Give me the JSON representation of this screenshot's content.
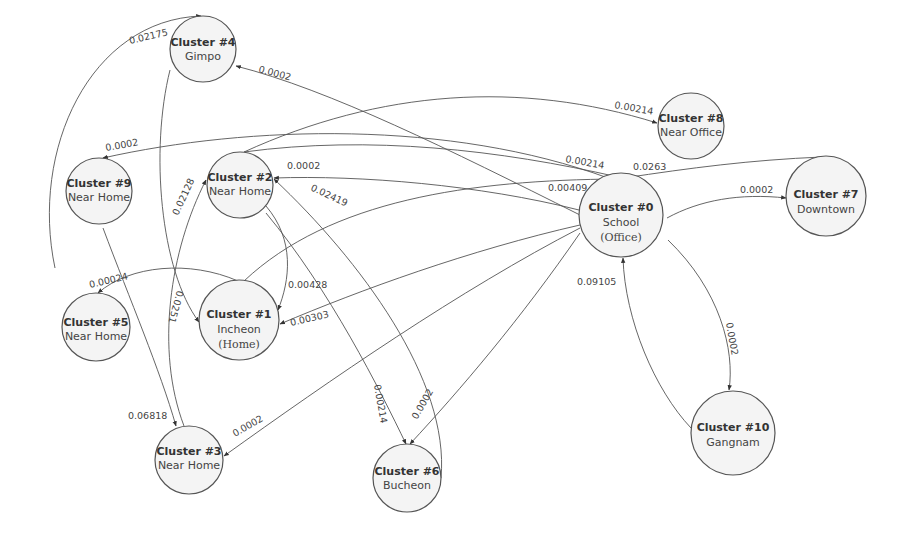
{
  "nodes": [
    {
      "id": "c4",
      "title": "Cluster #4",
      "sub": "Gimpo",
      "cx": 203,
      "cy": 49,
      "r": 33
    },
    {
      "id": "c8",
      "title": "Cluster #8",
      "sub": "Near Office",
      "cx": 691,
      "cy": 126,
      "r": 33
    },
    {
      "id": "c9",
      "title": "Cluster #9",
      "sub": "Near Home",
      "cx": 99,
      "cy": 191,
      "r": 33
    },
    {
      "id": "c2",
      "title": "Cluster #2",
      "sub": "Near Home",
      "cx": 240,
      "cy": 185,
      "r": 33
    },
    {
      "id": "c0",
      "title": "Cluster #0",
      "sub": "School",
      "sub2": "(Office)",
      "cx": 621,
      "cy": 215,
      "r": 42
    },
    {
      "id": "c7",
      "title": "Cluster #7",
      "sub": "Downtown",
      "cx": 826,
      "cy": 196,
      "r": 40
    },
    {
      "id": "c5",
      "title": "Cluster #5",
      "sub": "Near Home",
      "cx": 96,
      "cy": 327,
      "r": 34
    },
    {
      "id": "c1",
      "title": "Cluster #1",
      "sub": "Incheon",
      "sub2": "(Home)",
      "cx": 239,
      "cy": 320,
      "r": 40
    },
    {
      "id": "c3",
      "title": "Cluster #3",
      "sub": "Near Home",
      "cx": 189,
      "cy": 460,
      "r": 34
    },
    {
      "id": "c6",
      "title": "Cluster #6",
      "sub": "Bucheon",
      "cx": 407,
      "cy": 478,
      "r": 34
    },
    {
      "id": "c10",
      "title": "Cluster #10",
      "sub": "Gangnam",
      "cx": 733,
      "cy": 433,
      "r": 42
    }
  ],
  "edges": [
    {
      "from": "Cluster #5",
      "to": "Cluster #4",
      "weight": "0.02175"
    },
    {
      "from": "Cluster #0",
      "to": "Cluster #4",
      "weight": "0.0002"
    },
    {
      "from": "Cluster #2",
      "to": "Cluster #8",
      "weight": "0.00214"
    },
    {
      "from": "Cluster #0",
      "to": "Cluster #9",
      "weight": "0.0002"
    },
    {
      "from": "Cluster #2",
      "to": "Cluster #0",
      "weight": "0.00214"
    },
    {
      "from": "Cluster #7",
      "to": "Cluster #0",
      "weight": "0.0263"
    },
    {
      "from": "Cluster #0",
      "to": "Cluster #2",
      "weight": "0.0002"
    },
    {
      "from": "Cluster #1",
      "to": "Cluster #0",
      "weight": "0.00409"
    },
    {
      "from": "Cluster #0",
      "to": "Cluster #7",
      "weight": "0.0002"
    },
    {
      "from": "Cluster #6",
      "to": "Cluster #2",
      "weight": "0.02419"
    },
    {
      "from": "Cluster #3",
      "to": "Cluster #2",
      "weight": "0.02128"
    },
    {
      "from": "Cluster #1",
      "to": "Cluster #5",
      "weight": "0.00024"
    },
    {
      "from": "Cluster #2",
      "to": "Cluster #1",
      "weight": "0.00428"
    },
    {
      "from": "Cluster #4",
      "to": "Cluster #1",
      "weight": "0.0251"
    },
    {
      "from": "Cluster #0",
      "to": "Cluster #1",
      "weight": "0.00303"
    },
    {
      "from": "Cluster #10",
      "to": "Cluster #0",
      "weight": "0.09105"
    },
    {
      "from": "Cluster #0",
      "to": "Cluster #10",
      "weight": "0.0002"
    },
    {
      "from": "Cluster #9",
      "to": "Cluster #3",
      "weight": "0.06818"
    },
    {
      "from": "Cluster #0",
      "to": "Cluster #3",
      "weight": "0.0002"
    },
    {
      "from": "Cluster #2",
      "to": "Cluster #6",
      "weight": "0.00214"
    },
    {
      "from": "Cluster #0",
      "to": "Cluster #6",
      "weight": "0.0002"
    }
  ],
  "labels": {
    "e_5_4": "0.02175",
    "e_0_4": "0.0002",
    "e_2_8": "0.00214",
    "e_0_9": "0.0002",
    "e_2_0": "0.00214",
    "e_7_0": "0.0263",
    "e_0_2": "0.0002",
    "e_1_0": "0.00409",
    "e_0_7": "0.0002",
    "e_6_2": "0.02419",
    "e_3_2": "0.02128",
    "e_1_5": "0.00024",
    "e_2_1": "0.00428",
    "e_4_1": "0.0251",
    "e_0_1": "0.00303",
    "e_10_0": "0.09105",
    "e_0_10": "0.0002",
    "e_9_3": "0.06818",
    "e_0_3": "0.0002",
    "e_2_6": "0.00214",
    "e_0_6": "0.0002"
  },
  "colors": {
    "node_fill": "#f4f4f4",
    "stroke": "#555555",
    "text": "#333333",
    "background": "#ffffff"
  }
}
